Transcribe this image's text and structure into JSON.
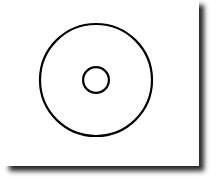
{
  "diagram": {
    "title": "",
    "shapes": [
      {
        "name": "outer-circle",
        "type": "circle",
        "role": "outer ring",
        "stroke": "#000000",
        "fill": "none"
      },
      {
        "name": "inner-circle",
        "type": "circle",
        "role": "center hole",
        "stroke": "#000000",
        "fill": "none"
      }
    ],
    "relative_radius_inner_to_outer": 0.23,
    "concentric": true,
    "background": "#ffffff",
    "shadow": true
  }
}
